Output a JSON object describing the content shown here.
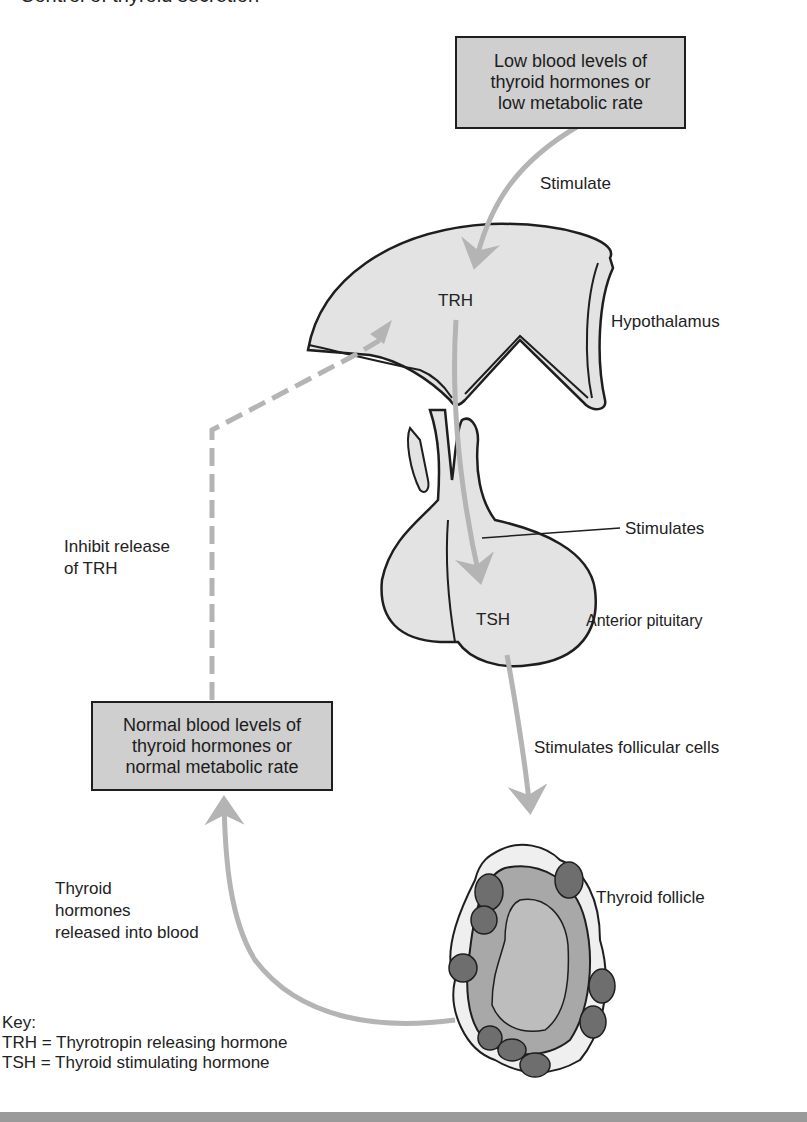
{
  "title_partial": "Control of thyroid secretion",
  "boxes": {
    "low": {
      "lines": [
        "Low blood levels of",
        "thyroid hormones or",
        "low metabolic rate"
      ]
    },
    "normal": {
      "lines": [
        "Normal blood levels of",
        "thyroid hormones or",
        "normal metabolic rate"
      ]
    }
  },
  "labels": {
    "stimulate": "Stimulate",
    "trh": "TRH",
    "hypothalamus": "Hypothalamus",
    "stimulates": "Stimulates",
    "tsh": "TSH",
    "anterior_pituitary": "Anterior pituitary",
    "inhibit": [
      "Inhibit release",
      "of TRH"
    ],
    "stimulates_follicular": "Stimulates follicular cells",
    "thyroid_follicle": "Thyroid follicle",
    "hormones_released": [
      "Thyroid",
      "hormones",
      "released into blood"
    ]
  },
  "key": {
    "heading": "Key:",
    "entries": [
      "TRH = Thyrotropin releasing hormone",
      "TSH = Thyroid stimulating hormone"
    ]
  },
  "colors": {
    "box_fill": "#cfcfcf",
    "organ_fill": "#e3e3e3",
    "arrow": "#b4b4b4",
    "outline": "#1e1e1e",
    "cell_dark": "#6e6e6e",
    "cell_mid": "#a8a8a8",
    "colloid": "#bdbdbd"
  }
}
